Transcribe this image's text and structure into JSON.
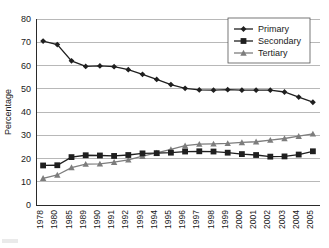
{
  "chart_data": {
    "type": "line",
    "title": "",
    "xlabel": "",
    "ylabel": "Percentage",
    "ylim": [
      0,
      80
    ],
    "ytick_step": 10,
    "grid": true,
    "legend_position": "top-right",
    "categories": [
      "1978",
      "1980",
      "1985",
      "1989",
      "1990",
      "1991",
      "1992",
      "1993",
      "1994",
      "1995",
      "1996",
      "1997",
      "1998",
      "1999",
      "2000",
      "2001",
      "2002",
      "2003",
      "2004",
      "2005"
    ],
    "yticks": [
      "0",
      "10",
      "20",
      "30",
      "40",
      "50",
      "60",
      "70",
      "80"
    ],
    "series": [
      {
        "name": "Primary",
        "marker": "diamond",
        "color": "#1f1f1f",
        "values": [
          70.5,
          69.0,
          62.0,
          59.6,
          59.8,
          59.5,
          58.2,
          56.2,
          54.0,
          51.8,
          50.2,
          49.5,
          49.4,
          49.6,
          49.4,
          49.4,
          49.4,
          48.6,
          46.4,
          44.2
        ]
      },
      {
        "name": "Secondary",
        "marker": "square",
        "color": "#1f1f1f",
        "values": [
          17.0,
          17.1,
          20.6,
          21.4,
          21.3,
          21.1,
          21.5,
          22.2,
          22.3,
          22.5,
          23.0,
          23.1,
          23.0,
          22.5,
          21.9,
          21.5,
          20.8,
          20.9,
          21.7,
          23.1
        ]
      },
      {
        "name": "Tertiary",
        "marker": "triangle",
        "color": "#7d7d7d",
        "values": [
          11.5,
          12.9,
          16.1,
          17.6,
          17.7,
          18.4,
          19.4,
          21.0,
          22.4,
          23.9,
          25.5,
          26.2,
          26.3,
          26.5,
          26.9,
          27.2,
          27.9,
          28.6,
          29.6,
          30.6
        ]
      }
    ]
  },
  "legend": {
    "entries": [
      {
        "label": "Primary"
      },
      {
        "label": "Secondary"
      },
      {
        "label": "Tertiary"
      }
    ]
  }
}
